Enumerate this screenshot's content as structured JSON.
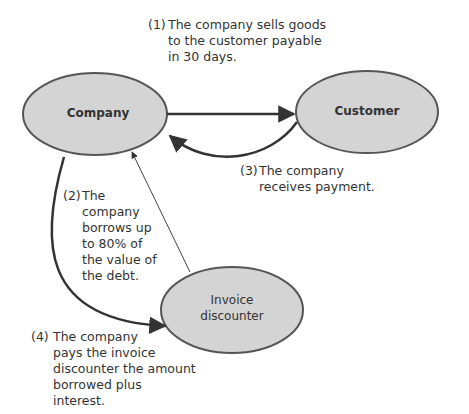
{
  "nodes": {
    "company": "Company",
    "customer": "Customer",
    "discounter_line1": "Invoice",
    "discounter_line2": "discounter"
  },
  "steps": {
    "s1": {
      "num": "(1)",
      "lines": [
        "The company sells goods",
        "to the customer payable",
        "in 30 days."
      ]
    },
    "s2": {
      "num": "(2)",
      "lines": [
        "The",
        "company",
        "borrows up",
        "to 80% of",
        "the value of",
        "the debt."
      ]
    },
    "s3": {
      "num": "(3)",
      "lines": [
        "The company",
        "receives payment."
      ]
    },
    "s4": {
      "num": "(4)",
      "lines": [
        "The company",
        "pays the invoice",
        "discounter the amount",
        "borrowed plus",
        "interest."
      ]
    }
  },
  "colors": {
    "node_fill": "#d4d4d4",
    "stroke": "#555555",
    "text": "#333333"
  }
}
